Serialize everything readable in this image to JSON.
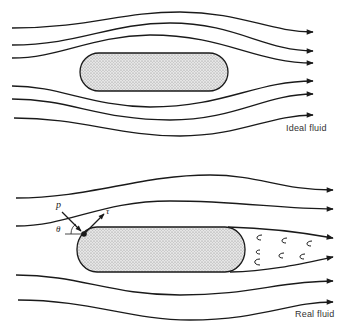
{
  "figure": {
    "panels": [
      {
        "id": "ideal",
        "label": "Ideal fluid",
        "body": {
          "x": 80,
          "y": 53,
          "width": 148,
          "height": 38,
          "fill": "#d9d9d9"
        },
        "streamlines": [
          "M12,28 C90,28 120,12 180,12 C240,12 270,32 313,32",
          "M12,45 C80,45 110,23 170,23 C235,23 265,51 313,51",
          "M12,58 C60,58 90,36 150,35 C225,35 255,63 313,63",
          "M12,86 C60,86 90,106 150,107 C225,107 255,81 313,81",
          "M12,99 C70,99 100,120 170,120 C235,120 265,94 313,94",
          "M14,118 C80,118 120,136 180,136 C240,136 270,115 313,115"
        ]
      },
      {
        "id": "real",
        "label": "Real fluid",
        "body": {
          "x": 77,
          "y": 227,
          "width": 168,
          "height": 45,
          "fill": "#d9d9d9"
        },
        "streamlines": [
          "M16,198 C90,198 140,175 210,175 C260,175 280,190 333,190",
          "M16,226 C80,226 110,200 180,200 C250,200 280,209 333,209",
          "M16,275 C80,275 110,295 180,295 C250,295 280,281 333,281",
          "M18,300 C90,300 130,320 190,320 C260,320 290,302 333,302"
        ],
        "wake_lines": [
          "M232,227 C270,228 300,232 333,238",
          "M236,271 C270,270 300,264 333,257"
        ],
        "eddies": [
          [
            259,
            237
          ],
          [
            283,
            240
          ],
          [
            308,
            242
          ],
          [
            258,
            252
          ],
          [
            280,
            255
          ],
          [
            302,
            256
          ],
          [
            256,
            262
          ]
        ],
        "annotations": {
          "pressure": {
            "symbol": "p"
          },
          "shear": {
            "symbol": "τ"
          },
          "angle": {
            "symbol": "θ"
          }
        }
      }
    ],
    "colors": {
      "stroke": "#1a1a1a",
      "body_fill": "#d6d6d6",
      "text": "#333333"
    }
  }
}
